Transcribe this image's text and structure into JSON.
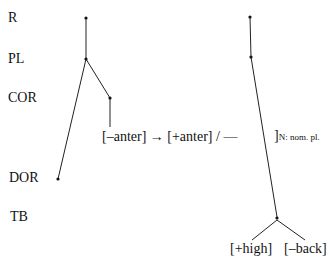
{
  "tiers": [
    {
      "label": "R",
      "x": 8,
      "y": 10
    },
    {
      "label": "PL",
      "x": 8,
      "y": 51
    },
    {
      "label": "COR",
      "x": 8,
      "y": 90
    },
    {
      "label": "DOR",
      "x": 9,
      "y": 170
    },
    {
      "label": "TB",
      "x": 10,
      "y": 209
    }
  ],
  "rule": {
    "text": "[–anter] → [+anter] / —",
    "context_bracket": "]",
    "context_subscript": "N: nom. pl."
  },
  "features": {
    "high": "[+high]",
    "back": "[–back]"
  }
}
